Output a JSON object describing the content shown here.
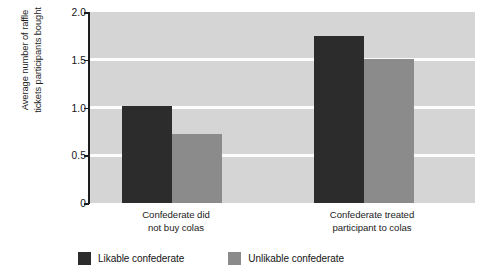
{
  "chart_data": {
    "type": "bar",
    "title": "",
    "xlabel": "",
    "ylabel": "Average number of raffle\ntickets participants bought",
    "categories": [
      "Confederate did\nnot buy colas",
      "Confederate treated\nparticipant to colas"
    ],
    "series": [
      {
        "name": "Likable confederate",
        "color": "#2c2c2c",
        "values": [
          1.02,
          1.75
        ]
      },
      {
        "name": "Unlikable confederate",
        "color": "#8b8b8b",
        "values": [
          0.72,
          1.51
        ]
      }
    ],
    "ylim": [
      0,
      2.0
    ],
    "yticks": [
      0,
      0.5,
      1.0,
      1.5,
      2.0
    ],
    "ytick_labels": [
      "0",
      "0.5",
      "1.0",
      "1.5",
      "2.0"
    ],
    "grid": true,
    "gridlines_at": [
      0.5,
      1.0,
      1.5
    ],
    "grid_color": "#fdfdfd",
    "plot_background": "#d5d5d5",
    "legend_position": "bottom-left",
    "legend": [
      {
        "label": "Likable confederate",
        "color": "#2c2c2c"
      },
      {
        "label": "Unlikable confederate",
        "color": "#8b8b8b"
      }
    ]
  }
}
